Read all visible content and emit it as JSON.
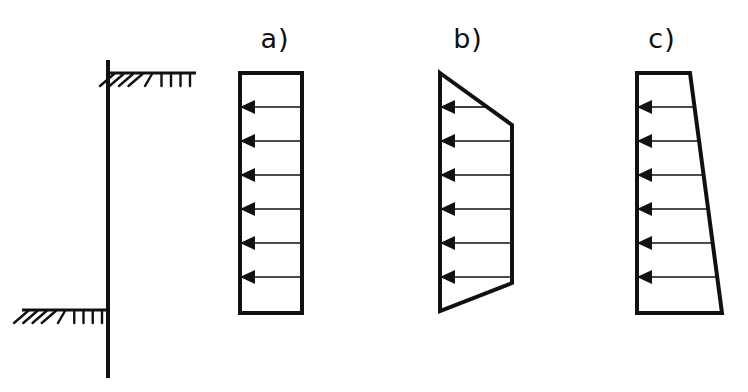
{
  "figure": {
    "title": "",
    "background_color": "#ffffff",
    "line_color": "#111111",
    "width": 748,
    "height": 392
  },
  "wall": {
    "name": "cantilever-retaining-wall",
    "description": "Vertical retaining wall stem drawn as a single heavy vertical line",
    "x": 108,
    "top_y": 62,
    "bottom_y": 376,
    "stroke_width": 4
  },
  "ground_lines": [
    {
      "name": "upper-ground-line",
      "label": "retained (upper) ground surface",
      "y": 73,
      "x_start": 108,
      "x_end": 196,
      "side": "right",
      "hatch_direction": "below"
    },
    {
      "name": "lower-ground-line",
      "label": "excavated (lower) ground surface",
      "y": 310,
      "x_start": 22,
      "x_end": 108,
      "side": "left",
      "hatch_direction": "below"
    }
  ],
  "diagrams": [
    {
      "id": "a",
      "label": "a)",
      "label_x": 275,
      "label_y": 48,
      "pressure_type": "uniform",
      "shape": "rectangle",
      "description": "Uniform (rectangular) earth pressure distribution, constant with depth",
      "box": {
        "left": 240,
        "right": 302,
        "top": 73,
        "bottom": 313
      },
      "outline_points": "240,73 302,73 302,313 240,313",
      "arrow_count": 6,
      "arrow_rows": [
        {
          "y": 107,
          "tail_x": 302,
          "head_x": 240,
          "relative_magnitude": 1.0
        },
        {
          "y": 141,
          "tail_x": 302,
          "head_x": 240,
          "relative_magnitude": 1.0
        },
        {
          "y": 175,
          "tail_x": 302,
          "head_x": 240,
          "relative_magnitude": 1.0
        },
        {
          "y": 209,
          "tail_x": 302,
          "head_x": 240,
          "relative_magnitude": 1.0
        },
        {
          "y": 243,
          "tail_x": 302,
          "head_x": 240,
          "relative_magnitude": 1.0
        },
        {
          "y": 277,
          "tail_x": 302,
          "head_x": 240,
          "relative_magnitude": 1.0
        }
      ]
    },
    {
      "id": "b",
      "label": "b)",
      "label_x": 468,
      "label_y": 48,
      "pressure_type": "trapezoidal",
      "shape": "trapezoid",
      "description": "Trapezoidal earth pressure distribution, tapering at the top and bottom with a constant maximum through the middle",
      "box": {
        "left": 440,
        "right": 512,
        "top": 73,
        "bottom": 311
      },
      "outline_points": "440,73 512,125 512,283 440,311",
      "arrow_count": 6,
      "arrow_rows": [
        {
          "y": 107,
          "tail_x": 487,
          "head_x": 440,
          "relative_magnitude": 0.65
        },
        {
          "y": 141,
          "tail_x": 512,
          "head_x": 440,
          "relative_magnitude": 1.0
        },
        {
          "y": 175,
          "tail_x": 512,
          "head_x": 440,
          "relative_magnitude": 1.0
        },
        {
          "y": 209,
          "tail_x": 512,
          "head_x": 440,
          "relative_magnitude": 1.0
        },
        {
          "y": 243,
          "tail_x": 512,
          "head_x": 440,
          "relative_magnitude": 1.0
        },
        {
          "y": 277,
          "tail_x": 512,
          "head_x": 440,
          "relative_magnitude": 1.0
        }
      ]
    },
    {
      "id": "c",
      "label": "c)",
      "label_x": 662,
      "label_y": 48,
      "pressure_type": "triangular-increasing",
      "shape": "trapezoid",
      "description": "Earth pressure increasing linearly with depth, small at the top and maximum at the base",
      "box": {
        "left": 637,
        "right": 722,
        "top": 73,
        "bottom": 313
      },
      "outline_points": "637,73 690,73 722,313 637,313",
      "arrow_count": 6,
      "arrow_rows": [
        {
          "y": 107,
          "tail_x": 695,
          "head_x": 637,
          "relative_magnitude": 0.68
        },
        {
          "y": 141,
          "tail_x": 700,
          "head_x": 637,
          "relative_magnitude": 0.74
        },
        {
          "y": 175,
          "tail_x": 705,
          "head_x": 637,
          "relative_magnitude": 0.8
        },
        {
          "y": 209,
          "tail_x": 709,
          "head_x": 637,
          "relative_magnitude": 0.85
        },
        {
          "y": 243,
          "tail_x": 714,
          "head_x": 637,
          "relative_magnitude": 0.91
        },
        {
          "y": 277,
          "tail_x": 718,
          "head_x": 637,
          "relative_magnitude": 0.96
        }
      ]
    }
  ],
  "arrow": {
    "direction": "left",
    "head_length": 15,
    "head_half_width": 7,
    "shaft_width": 1.6
  }
}
